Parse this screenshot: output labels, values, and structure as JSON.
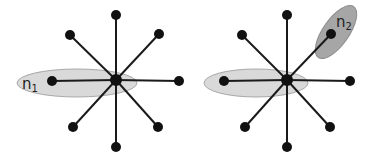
{
  "diagram": {
    "panels": [
      {
        "id": "left",
        "center": {
          "x": 116,
          "y": 80
        },
        "leaves": [
          {
            "x": 116,
            "y": 15
          },
          {
            "x": 159,
            "y": 34
          },
          {
            "x": 179,
            "y": 81
          },
          {
            "x": 158,
            "y": 127
          },
          {
            "x": 116,
            "y": 147
          },
          {
            "x": 73,
            "y": 127
          },
          {
            "x": 52,
            "y": 81
          },
          {
            "x": 70,
            "y": 35
          }
        ],
        "highlights": [
          {
            "label": "n",
            "subscript": "1",
            "cx": 77,
            "cy": 83,
            "rx": 60,
            "ry": 14,
            "angle": 0,
            "fill": "#d9d9d9",
            "stroke": "#a8a8a8",
            "label_x": 22,
            "label_y": 89
          }
        ]
      },
      {
        "id": "right",
        "center": {
          "x": 287,
          "y": 80
        },
        "leaves": [
          {
            "x": 287,
            "y": 15
          },
          {
            "x": 331,
            "y": 34
          },
          {
            "x": 350,
            "y": 81
          },
          {
            "x": 330,
            "y": 127
          },
          {
            "x": 287,
            "y": 147
          },
          {
            "x": 245,
            "y": 127
          },
          {
            "x": 224,
            "y": 81
          },
          {
            "x": 242,
            "y": 35
          }
        ],
        "highlights": [
          {
            "label": "",
            "subscript": "",
            "cx": 256,
            "cy": 83,
            "rx": 52,
            "ry": 14,
            "angle": 0,
            "fill": "#d9d9d9",
            "stroke": "#a8a8a8",
            "label_x": 0,
            "label_y": 0
          },
          {
            "label": "n",
            "subscript": "2",
            "cx": 336,
            "cy": 32,
            "rx": 31,
            "ry": 13,
            "angle": -55,
            "fill": "#a6a6a6",
            "stroke": "#8c8c8c",
            "label_x": 336,
            "label_y": 27
          }
        ]
      }
    ],
    "node_radius": 5,
    "center_radius": 6
  }
}
